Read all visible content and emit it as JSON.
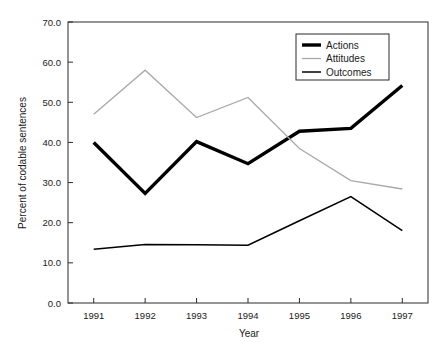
{
  "chart_data": {
    "type": "line",
    "title": "",
    "xlabel": "Year",
    "ylabel": "Percent of codable sentences",
    "x": [
      1991,
      1992,
      1993,
      1994,
      1995,
      1996,
      1997
    ],
    "xtick_labels": [
      "1991",
      "1992",
      "1993",
      "1994",
      "1995",
      "1996",
      "1997"
    ],
    "xlim": [
      1990.5,
      1997.5
    ],
    "ylim": [
      0.0,
      70.0
    ],
    "ytick_labels": [
      "0.0",
      "10.0",
      "20.0",
      "30.0",
      "40.0",
      "50.0",
      "60.0",
      "70.0"
    ],
    "yticks": [
      0.0,
      10.0,
      20.0,
      30.0,
      40.0,
      50.0,
      60.0,
      70.0
    ],
    "grid": false,
    "legend_position": "upper right",
    "series": [
      {
        "name": "Actions",
        "values": [
          40.0,
          27.3,
          40.2,
          34.7,
          42.8,
          43.5,
          54.2
        ],
        "color": "#000000",
        "width": 3.4
      },
      {
        "name": "Attitudes",
        "values": [
          47.0,
          58.0,
          46.2,
          51.2,
          38.5,
          30.5,
          28.4
        ],
        "color": "#a9a9a9",
        "width": 1.3
      },
      {
        "name": "Outcomes",
        "values": [
          13.4,
          14.6,
          14.5,
          14.4,
          20.5,
          26.5,
          18.0
        ],
        "color": "#000000",
        "width": 1.5
      }
    ]
  },
  "legend": {
    "entries": [
      "Actions",
      "Attitudes",
      "Outcomes"
    ]
  },
  "caption": {
    "text": ""
  }
}
